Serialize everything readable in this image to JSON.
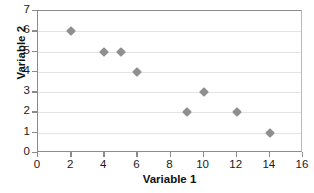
{
  "chart_data": {
    "type": "scatter",
    "title": "",
    "xlabel": "Variable 1",
    "ylabel": "Variable 2",
    "xlim": [
      0,
      16
    ],
    "ylim": [
      0,
      7
    ],
    "xticks": [
      "0",
      "2",
      "4",
      "6",
      "8",
      "10",
      "12",
      "14",
      "16"
    ],
    "yticks": [
      "0",
      "1",
      "2",
      "3",
      "4",
      "5",
      "6",
      "7"
    ],
    "grid": "horizontal",
    "legend": "none",
    "marker": "diamond",
    "marker_color": "#8f8f8f",
    "gridline_color": "#e3e3e3",
    "axis_color": "#8b8b8b",
    "points": [
      {
        "x": 2,
        "y": 6
      },
      {
        "x": 4,
        "y": 5
      },
      {
        "x": 5,
        "y": 5
      },
      {
        "x": 6,
        "y": 4
      },
      {
        "x": 9,
        "y": 2
      },
      {
        "x": 10,
        "y": 3
      },
      {
        "x": 12,
        "y": 2
      },
      {
        "x": 14,
        "y": 1
      }
    ],
    "x": [
      2,
      4,
      5,
      6,
      9,
      10,
      12,
      14
    ],
    "values": [
      6,
      5,
      5,
      4,
      2,
      3,
      2,
      1
    ]
  }
}
